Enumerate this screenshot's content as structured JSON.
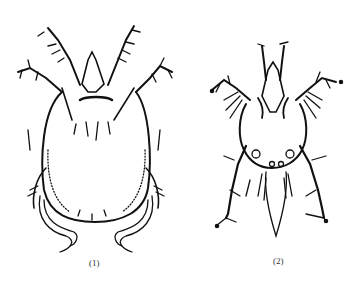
{
  "figure": {
    "panels": [
      {
        "id": "1",
        "label": "(1)",
        "subject": "mite-dorsal-view-oval-body"
      },
      {
        "id": "2",
        "label": "(2)",
        "subject": "mite-dorsal-view-long-legs"
      }
    ],
    "colors": {
      "ink": "#111111",
      "background": "#ffffff",
      "label": "#333333"
    }
  }
}
